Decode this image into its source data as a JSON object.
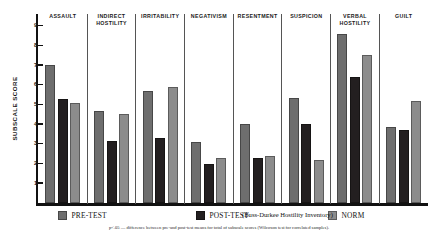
{
  "chart_data": {
    "type": "bar",
    "title": "",
    "subtitle": "(Buss-Durkee Hostility Inventory)",
    "xlabel": "",
    "ylabel": "SUBSCALE SCORE",
    "ylim": [
      0,
      9.6
    ],
    "ytick_labels": [
      "1",
      "2",
      "3",
      "4",
      "5",
      "6",
      "7",
      "8",
      "9"
    ],
    "ytick_values": [
      1,
      2,
      3,
      4,
      5,
      6,
      7,
      8,
      9
    ],
    "grid": false,
    "legend_position": "bottom",
    "categories": [
      "ASSAULT",
      "INDIRECT HOSTILITY",
      "IRRITABILITY",
      "NEGATIVISM",
      "RESENTMENT",
      "SUSPICION",
      "VERBAL HOSTILITY",
      "GUILT"
    ],
    "category_lines": [
      [
        "ASSAULT"
      ],
      [
        "INDIRECT",
        "HOSTILITY"
      ],
      [
        "IRRITABILITY"
      ],
      [
        "NEGATIVISM"
      ],
      [
        "RESENTMENT"
      ],
      [
        "SUSPICION"
      ],
      [
        "VERBAL",
        "HOSTILITY"
      ],
      [
        "GUILT"
      ]
    ],
    "series": [
      {
        "name": "PRE-TEST",
        "color": "#6e6e6e",
        "values": [
          7.0,
          4.65,
          5.7,
          3.1,
          4.0,
          5.35,
          8.6,
          3.85
        ]
      },
      {
        "name": "POST-TEST",
        "color": "#231f20",
        "values": [
          5.3,
          3.15,
          3.3,
          2.0,
          2.3,
          4.0,
          6.4,
          3.7
        ]
      },
      {
        "name": "NORM",
        "color": "#8c8c8c",
        "values": [
          5.1,
          4.5,
          5.9,
          2.3,
          2.4,
          2.2,
          7.5,
          5.2
        ]
      }
    ],
    "annotations": {
      "footnote": "p<.05 — difference between pre-and post-test means for total of subscale scores  (Wilcoxon test for correlated samples)."
    }
  },
  "axis": {
    "y_title": "SUBSCALE SCORE"
  },
  "legend": {
    "items": [
      {
        "label": "PRE-TEST",
        "color": "#6e6e6e"
      },
      {
        "label": "POST-TEST",
        "color": "#231f20"
      },
      {
        "label": "NORM",
        "color": "#8c8c8c"
      }
    ]
  },
  "caption": {
    "inventory": "(Buss-Durkee Hostility Inventory)",
    "footnote": "p<.05 — difference between pre-and post-test means for total of subscale scores  (Wilcoxon test for correlated samples)."
  }
}
